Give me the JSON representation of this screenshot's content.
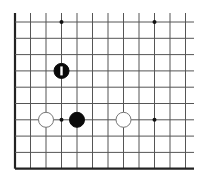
{
  "diagram": {
    "type": "go-board-fragment",
    "background": "#ffffff",
    "line_color": "#555555",
    "edge_color": "#222222",
    "columns_x": [
      15,
      30.5,
      46,
      61.5,
      77,
      92.5,
      108,
      123.5,
      139,
      154.5,
      170,
      185.5
    ],
    "rows_y": [
      22,
      38.3,
      54.6,
      70.9,
      87.2,
      103.5,
      119.8,
      136.1,
      152.4,
      168.7
    ],
    "line_extent": {
      "top": 13,
      "right": 194
    },
    "edges": {
      "left": true,
      "bottom": true
    },
    "star_points": [
      {
        "col": 3,
        "row": 0
      },
      {
        "col": 9,
        "row": 0
      },
      {
        "col": 3,
        "row": 6
      },
      {
        "col": 9,
        "row": 6
      }
    ],
    "stones": [
      {
        "color": "black",
        "col": 3,
        "row": 3,
        "marker": "vertical-bar"
      },
      {
        "color": "white",
        "col": 2,
        "row": 6
      },
      {
        "color": "black",
        "col": 4,
        "row": 6
      },
      {
        "color": "white",
        "col": 7,
        "row": 6
      }
    ],
    "stone_radius": 7.5
  }
}
